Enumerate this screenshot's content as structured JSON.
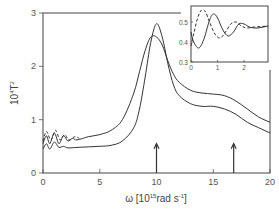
{
  "chart_data": [
    {
      "type": "line",
      "title": "",
      "xlabel": "ω [10^15 rad s^-1]",
      "ylabel": "10^4 T^2",
      "xlim": [
        0,
        20
      ],
      "ylim": [
        0,
        3
      ],
      "x_ticks": [
        "0",
        "5",
        "10",
        "15",
        "20"
      ],
      "y_ticks": [
        "0",
        "1",
        "2",
        "3"
      ],
      "grid": false,
      "legend": null,
      "series": [
        {
          "name": "solid curve (upper)",
          "style": "solid",
          "x": [
            0,
            0.3,
            0.6,
            1.0,
            1.4,
            1.8,
            2.2,
            2.6,
            3.0,
            4,
            5,
            6,
            7,
            8,
            8.5,
            9,
            9.5,
            10,
            10.5,
            11,
            11.5,
            12,
            13,
            14,
            15,
            16,
            17,
            18,
            19,
            20
          ],
          "y": [
            0.55,
            0.7,
            0.55,
            0.75,
            0.55,
            0.7,
            0.6,
            0.65,
            0.62,
            0.68,
            0.72,
            0.8,
            1.0,
            1.5,
            1.9,
            2.3,
            2.55,
            2.55,
            2.4,
            2.1,
            1.85,
            1.7,
            1.55,
            1.5,
            1.48,
            1.45,
            1.35,
            1.2,
            1.05,
            0.95
          ]
        },
        {
          "name": "solid curve (lower, sharp peak)",
          "style": "solid",
          "x": [
            0,
            0.3,
            0.6,
            1.0,
            1.4,
            1.8,
            2.2,
            3,
            4,
            5,
            6,
            7,
            8,
            8.5,
            9,
            9.5,
            10,
            10.5,
            11,
            11.5,
            12,
            13,
            14,
            15,
            16,
            17,
            18,
            19,
            20
          ],
          "y": [
            0.45,
            0.55,
            0.45,
            0.58,
            0.48,
            0.5,
            0.47,
            0.48,
            0.49,
            0.5,
            0.52,
            0.6,
            0.85,
            1.2,
            1.8,
            2.45,
            2.8,
            2.55,
            2.05,
            1.65,
            1.45,
            1.3,
            1.25,
            1.25,
            1.2,
            1.1,
            0.95,
            0.85,
            0.75
          ]
        },
        {
          "name": "dashed curve",
          "style": "dashed",
          "x": [
            0,
            0.3,
            0.7,
            1.1,
            1.5,
            1.9,
            2.3,
            2.8,
            3.2
          ],
          "y": [
            0.6,
            0.78,
            0.62,
            0.8,
            0.62,
            0.72,
            0.62,
            0.68,
            0.65
          ]
        }
      ],
      "annotations": [
        {
          "type": "arrow",
          "x": 10,
          "from_y": 0,
          "to_y": 0.55
        },
        {
          "type": "arrow",
          "x": 16.8,
          "from_y": 0,
          "to_y": 0.55
        }
      ]
    },
    {
      "type": "line",
      "title": "inset",
      "xlim": [
        0,
        2.9
      ],
      "ylim": [
        0.3,
        0.58
      ],
      "x_ticks": [
        "0",
        "1",
        "2"
      ],
      "y_ticks": [
        "0.3",
        "0.4",
        "0.5"
      ],
      "series": [
        {
          "name": "solid",
          "style": "solid",
          "x": [
            0,
            0.1,
            0.3,
            0.5,
            0.7,
            0.85,
            1.0,
            1.2,
            1.4,
            1.6,
            1.8,
            2.0,
            2.2,
            2.5,
            2.9
          ],
          "y": [
            0.45,
            0.4,
            0.37,
            0.42,
            0.51,
            0.54,
            0.52,
            0.46,
            0.43,
            0.45,
            0.49,
            0.49,
            0.475,
            0.47,
            0.48
          ]
        },
        {
          "name": "dashed",
          "style": "dashed",
          "x": [
            0,
            0.1,
            0.25,
            0.4,
            0.55,
            0.7,
            0.9,
            1.1,
            1.3,
            1.5,
            1.7,
            1.9,
            2.1,
            2.4,
            2.9
          ],
          "y": [
            0.38,
            0.44,
            0.52,
            0.56,
            0.55,
            0.5,
            0.44,
            0.42,
            0.45,
            0.49,
            0.5,
            0.48,
            0.47,
            0.475,
            0.48
          ]
        }
      ]
    }
  ],
  "labels": {
    "y_title_base": "10",
    "y_title_exp": "4",
    "y_title_var": "T",
    "y_title_var_exp": "2",
    "x_title_pre": "ω [10",
    "x_title_exp": "15",
    "x_title_mid": "rad s",
    "x_title_exp2": "-1",
    "x_title_post": "]"
  },
  "colors": {
    "axis": "#555555",
    "curve": "#333333",
    "background": "#ffffff"
  }
}
